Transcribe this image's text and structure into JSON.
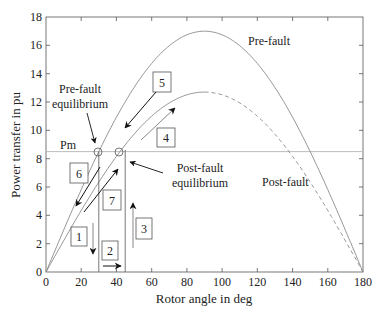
{
  "chart_data": {
    "type": "line",
    "title": "",
    "xlabel": "Rotor angle in deg",
    "ylabel": "Power transfer in pu",
    "xlim": [
      0,
      180
    ],
    "ylim": [
      0,
      18
    ],
    "xticks": [
      "0",
      "20",
      "40",
      "60",
      "80",
      "100",
      "120",
      "140",
      "160",
      "180"
    ],
    "yticks": [
      "0",
      "2",
      "4",
      "6",
      "8",
      "10",
      "12",
      "14",
      "16",
      "18"
    ],
    "grid": false,
    "series": [
      {
        "name": "Pre-fault",
        "formula": "17*sin(delta)",
        "peak": 17.0,
        "style": "solid",
        "color": "#8a8a8a"
      },
      {
        "name": "Post-fault",
        "formula": "12.7*sin(delta)",
        "peak": 12.7,
        "style": "solid to 90 deg, dashed after",
        "color": "#8a8a8a"
      },
      {
        "name": "Pm",
        "value": 8.5,
        "style": "horizontal line",
        "color": "#b0b0b0"
      }
    ],
    "annotations": [
      {
        "text": "Pre-fault",
        "x": 118,
        "y": 16.2
      },
      {
        "text": "Post-fault",
        "x": 128,
        "y": 8.0
      },
      {
        "text": "Pm",
        "x": 4,
        "y": 9.0
      },
      {
        "text": "Pre-fault equilibrium",
        "point": [
          30,
          8.5
        ]
      },
      {
        "text": "Post-fault equilibrium",
        "point": [
          42,
          8.5
        ]
      },
      {
        "text": "1"
      },
      {
        "text": "2"
      },
      {
        "text": "3"
      },
      {
        "text": "4"
      },
      {
        "text": "5"
      },
      {
        "text": "6"
      },
      {
        "text": "7"
      }
    ],
    "vertical_lines_deg": [
      30,
      45
    ]
  },
  "labels": {
    "xlabel": "Rotor angle in deg",
    "ylabel": "Power transfer in pu",
    "prefault": "Pre-fault",
    "postfault": "Post-fault",
    "pm": "Pm",
    "pre_eq_1": "Pre-fault",
    "pre_eq_2": "equilibrium",
    "post_eq_1": "Post-fault",
    "post_eq_2": "equilibrium",
    "box1": "1",
    "box2": "2",
    "box3": "3",
    "box4": "4",
    "box5": "5",
    "box6": "6",
    "box7": "7"
  },
  "ticks": {
    "x": [
      "0",
      "20",
      "40",
      "60",
      "80",
      "100",
      "120",
      "140",
      "160",
      "180"
    ],
    "y": [
      "0",
      "2",
      "4",
      "6",
      "8",
      "10",
      "12",
      "14",
      "16",
      "18"
    ]
  }
}
